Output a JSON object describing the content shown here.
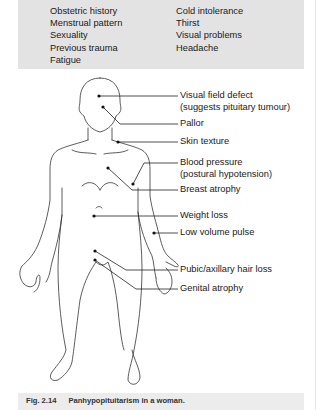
{
  "history_box": {
    "left_column": [
      "Obstetric history",
      "Menstrual pattern",
      "Sexuality",
      "Previous trauma",
      "Fatigue"
    ],
    "right_column": [
      "Cold intolerance",
      "Thirst",
      "Visual problems",
      "Headache"
    ],
    "background": "#e3e3e3"
  },
  "figure": {
    "annotations": [
      {
        "line1": "Visual field defect",
        "line2": "(suggests pituitary tumour)",
        "site": "eye"
      },
      {
        "line1": "Pallor",
        "site": "face"
      },
      {
        "line1": "Skin texture",
        "site": "upper chest"
      },
      {
        "line1": "Blood pressure",
        "line2": "(postural hypotension)",
        "site": "upper arm"
      },
      {
        "line1": "Breast atrophy",
        "site": "breast"
      },
      {
        "line1": "Weight loss",
        "site": "abdomen"
      },
      {
        "line1": "Low volume pulse",
        "site": "wrist"
      },
      {
        "line1": "Pubic/axillary hair loss",
        "site": "pubic region"
      },
      {
        "line1": "Genital atrophy",
        "site": "genitals"
      }
    ]
  },
  "caption": {
    "number": "Fig. 2.14",
    "text": "Panhypopituitarism in a woman."
  }
}
